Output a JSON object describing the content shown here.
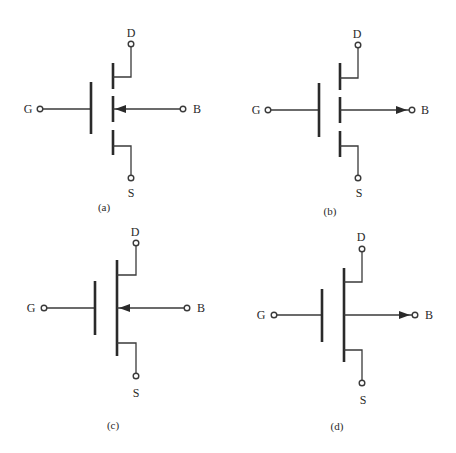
{
  "figure": {
    "background": "#ffffff",
    "ink": "#2a2a2a",
    "symbols": [
      {
        "id": "a",
        "caption": "(a)",
        "type": "enhancement-nmos-arrow-in",
        "channel": "segmented",
        "bulk_arrow": "inward",
        "labels": {
          "G": "G",
          "D": "D",
          "S": "S",
          "B": "B"
        },
        "geom": {
          "gate_plate_x": 91,
          "gate_plate_y1": 82,
          "gate_plate_y2": 134,
          "channel_x": 113,
          "channel_segments": [
            [
              63,
              89
            ],
            [
              96,
              122
            ],
            [
              130,
              155
            ]
          ],
          "mid_y": 109,
          "drain_y": 77,
          "source_y": 146,
          "term_x": 131,
          "d_term_y": 44,
          "s_term_y": 178,
          "g_term_x": 40,
          "b_term_x": 183,
          "arrow_tip_x": 115,
          "d_label": [
            131,
            37
          ],
          "s_label": [
            131,
            197
          ],
          "g_label": [
            28,
            113
          ],
          "b_label": [
            197,
            113
          ],
          "caption_pos": [
            104,
            211
          ]
        }
      },
      {
        "id": "b",
        "caption": "(b)",
        "type": "enhancement-pmos-arrow-out",
        "channel": "segmented",
        "bulk_arrow": "outward",
        "labels": {
          "G": "G",
          "D": "D",
          "S": "S",
          "B": "B"
        },
        "geom": {
          "gate_plate_x": 319,
          "gate_plate_y1": 83,
          "gate_plate_y2": 137,
          "channel_x": 340,
          "channel_segments": [
            [
              63,
              90
            ],
            [
              97,
              123
            ],
            [
              131,
              157
            ]
          ],
          "mid_y": 110,
          "drain_y": 78,
          "source_y": 146,
          "term_x": 358,
          "d_term_y": 45,
          "s_term_y": 178,
          "g_term_x": 268,
          "b_term_x": 412,
          "arrow_tip_x": 407,
          "d_label": [
            357,
            38
          ],
          "s_label": [
            359,
            197
          ],
          "g_label": [
            256,
            114
          ],
          "b_label": [
            425,
            114
          ],
          "caption_pos": [
            330,
            215
          ]
        }
      },
      {
        "id": "c",
        "caption": "(c)",
        "type": "depletion-nmos-arrow-in",
        "channel": "solid",
        "bulk_arrow": "inward",
        "labels": {
          "G": "G",
          "D": "D",
          "S": "S",
          "B": "B"
        },
        "geom": {
          "gate_plate_x": 95,
          "gate_plate_y1": 281,
          "gate_plate_y2": 335,
          "channel_x": 117,
          "channel_segments": [
            [
              260,
              356
            ]
          ],
          "mid_y": 308,
          "drain_y": 275,
          "source_y": 343,
          "term_x": 136,
          "d_term_y": 243,
          "s_term_y": 376,
          "g_term_x": 44,
          "b_term_x": 187,
          "arrow_tip_x": 119,
          "d_label": [
            135,
            236
          ],
          "s_label": [
            136,
            397
          ],
          "g_label": [
            31,
            312
          ],
          "b_label": [
            201,
            312
          ],
          "caption_pos": [
            113,
            429
          ]
        }
      },
      {
        "id": "d",
        "caption": "(d)",
        "type": "depletion-pmos-arrow-out",
        "channel": "solid",
        "bulk_arrow": "outward",
        "labels": {
          "G": "G",
          "D": "D",
          "S": "S",
          "B": "B"
        },
        "geom": {
          "gate_plate_x": 322,
          "gate_plate_y1": 289,
          "gate_plate_y2": 342,
          "channel_x": 344,
          "channel_segments": [
            [
              268,
              362
            ]
          ],
          "mid_y": 315,
          "drain_y": 282,
          "source_y": 350,
          "term_x": 362,
          "d_term_y": 249,
          "s_term_y": 383,
          "g_term_x": 274,
          "b_term_x": 415,
          "arrow_tip_x": 410,
          "d_label": [
            361,
            241
          ],
          "s_label": [
            363,
            404
          ],
          "g_label": [
            261,
            319
          ],
          "b_label": [
            429,
            319
          ],
          "caption_pos": [
            337,
            430
          ]
        }
      }
    ]
  }
}
